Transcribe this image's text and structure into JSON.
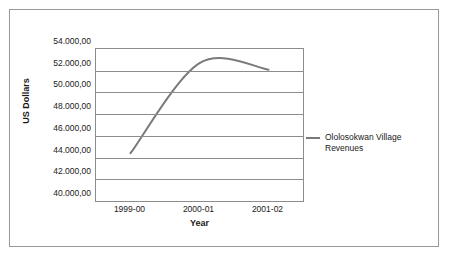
{
  "chart_data": {
    "type": "line",
    "title": "",
    "xlabel": "Year",
    "ylabel": "US Dollars",
    "categories": [
      "1999-00",
      "2000-01",
      "2001-02"
    ],
    "series": [
      {
        "name": "Ololosokwan Village Revenues",
        "values": [
          44400,
          52700,
          52100
        ],
        "color": "#7a7a7a"
      }
    ],
    "ylim": [
      40000,
      54000
    ],
    "ytick_step": 2000,
    "ytick_labels": [
      "54.000,00",
      "52.000,00",
      "50.000,00",
      "48.000,00",
      "46.000,00",
      "44.000,00",
      "42.000,00",
      "40.000,00"
    ],
    "ytick_values": [
      54000,
      52000,
      50000,
      48000,
      46000,
      44000,
      42000,
      40000
    ],
    "grid": true,
    "legend_position": "right",
    "smoothed": true,
    "annotations": []
  },
  "legend": {
    "entries": [
      {
        "label": "Ololosokwan Village Revenues",
        "color": "#7a7a7a"
      }
    ]
  },
  "colors": {
    "series_line": "#7a7a7a",
    "gridline": "#8c8c8c",
    "axis": "#8c8c8c",
    "frame_border": "#9a9a9a",
    "text": "#1a1a1a",
    "background": "#ffffff"
  }
}
